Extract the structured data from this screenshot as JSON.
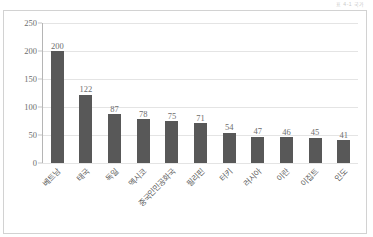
{
  "header": {
    "corner_text": "표 4-1  국가"
  },
  "chart_data": {
    "type": "bar",
    "title": "",
    "subtitle": "",
    "xlabel": "",
    "ylabel": "",
    "categories": [
      "베트남",
      "태국",
      "독일",
      "멕시코",
      "중국인민공화국",
      "필리핀",
      "터키",
      "러시아",
      "이란",
      "이집트",
      "인도"
    ],
    "values": [
      200,
      122,
      87,
      78,
      75,
      71,
      54,
      47,
      46,
      45,
      41
    ],
    "ylim": [
      0,
      250
    ],
    "yticks": [
      0,
      50,
      100,
      150,
      200,
      250
    ],
    "grid": true,
    "legend": false,
    "legend_position": "none",
    "bar_color": "#585858",
    "gridline_color": "#e4e4e4",
    "axis_color": "#b5b5b5",
    "label_color": "#6d6d6d",
    "data_labels": [
      "200",
      "122",
      "87",
      "78",
      "75",
      "71",
      "54",
      "47",
      "46",
      "45",
      "41"
    ]
  }
}
